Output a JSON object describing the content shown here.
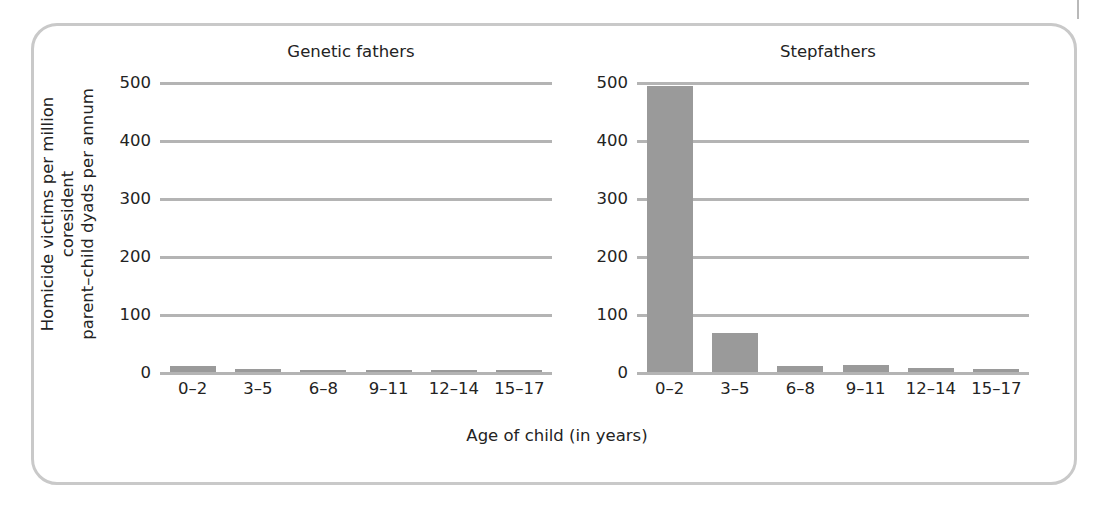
{
  "figure": {
    "frame_color": "#c9c9c9",
    "bar_color": "#9a9a9a",
    "gridline_color": "#b4b4b4"
  },
  "chart_data": {
    "type": "bar",
    "title": "",
    "xlabel": "Age of child (in years)",
    "ylabel": "Homicide victims per million coresident\nparent–child dyads per annum",
    "ylim": [
      0,
      500
    ],
    "yticks": [
      "0",
      "100",
      "200",
      "300",
      "400",
      "500"
    ],
    "ytick_values": [
      0,
      100,
      200,
      300,
      400,
      500
    ],
    "grid": "horizontal",
    "legend": "none",
    "categories": [
      "0–2",
      "3–5",
      "6–8",
      "9–11",
      "12–14",
      "15–17"
    ],
    "panels": [
      {
        "title": "Genetic fathers",
        "values": [
          10,
          6,
          4,
          3,
          3,
          3
        ]
      },
      {
        "title": "Stepfathers",
        "values": [
          493,
          68,
          10,
          12,
          7,
          5
        ]
      }
    ]
  }
}
